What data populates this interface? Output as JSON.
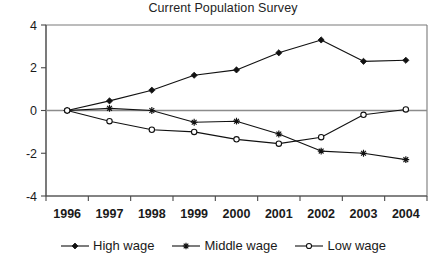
{
  "chart_data": {
    "type": "line",
    "title": "Current Population Survey",
    "xlabel": "",
    "ylabel": "",
    "categories": [
      "1996",
      "1997",
      "1998",
      "1999",
      "2000",
      "2001",
      "2002",
      "2003",
      "2004"
    ],
    "ylim": [
      -4,
      4
    ],
    "yticks": [
      4,
      2,
      0,
      -2,
      -4
    ],
    "grid": false,
    "legend_position": "bottom",
    "series": [
      {
        "name": "High wage",
        "marker": "filled-diamond",
        "values": [
          0,
          0.45,
          0.95,
          1.65,
          1.9,
          2.7,
          3.3,
          2.3,
          2.35
        ]
      },
      {
        "name": "Middle wage",
        "marker": "star",
        "values": [
          0,
          0.1,
          0.0,
          -0.55,
          -0.5,
          -1.1,
          -1.9,
          -2.0,
          -2.3
        ]
      },
      {
        "name": "Low wage",
        "marker": "open-circle",
        "values": [
          0,
          -0.5,
          -0.9,
          -1.0,
          -1.35,
          -1.55,
          -1.25,
          -0.2,
          0.05
        ]
      }
    ]
  },
  "axes": {
    "y_tick_labels": [
      "4",
      "2",
      "0",
      "-2",
      "-4"
    ],
    "x_tick_labels": [
      "1996",
      "1997",
      "1998",
      "1999",
      "2000",
      "2001",
      "2002",
      "2003",
      "2004"
    ]
  },
  "legend": {
    "entries": [
      {
        "label": "High wage",
        "marker": "filled-diamond"
      },
      {
        "label": "Middle wage",
        "marker": "star"
      },
      {
        "label": "Low wage",
        "marker": "open-circle"
      }
    ]
  },
  "colors": {
    "series": "#111111",
    "axis": "#4a4a4a",
    "border": "#7a7a7a",
    "background": "#ffffff",
    "text": "#1a1a1a"
  }
}
